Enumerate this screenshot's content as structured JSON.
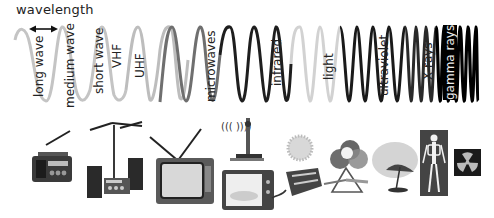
{
  "diagram": {
    "title_label": "wavelength",
    "bands": [
      {
        "id": "long-wave",
        "label": "long wave"
      },
      {
        "id": "medium-wave",
        "label": "medium wave"
      },
      {
        "id": "short-wave",
        "label": "short wave"
      },
      {
        "id": "vhf",
        "label": "VHF"
      },
      {
        "id": "uhf",
        "label": "UHF"
      },
      {
        "id": "microwaves",
        "label": "microwaves"
      },
      {
        "id": "infrared",
        "label": "infrared"
      },
      {
        "id": "light",
        "label": "light"
      },
      {
        "id": "ultraviolet",
        "label": "ultraviolet"
      },
      {
        "id": "x-rays",
        "label": "X-rays"
      },
      {
        "id": "gamma-rays",
        "label": "gamma rays"
      }
    ],
    "icons": [
      "radio-icon",
      "stereo-with-antenna-icon",
      "television-icon",
      "radio-mast-icon",
      "microwave-oven-icon",
      "sun-icon",
      "heater-icon",
      "color-circles-icon",
      "prism-icon",
      "sunshade-icon",
      "x-ray-skeleton-icon",
      "radiation-symbol-icon"
    ],
    "colors": {
      "light_gray_wave": "#c4c4c4",
      "mid_gray_wave": "#7a7a7a",
      "dark_wave": "#1a1a1a",
      "text": "#222222"
    }
  }
}
